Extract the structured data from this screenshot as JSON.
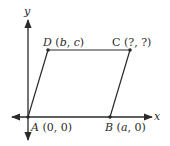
{
  "diagram": {
    "axes": {
      "x_label": "x",
      "y_label": "y"
    },
    "points": [
      {
        "name": "A",
        "coords": "(0, 0)",
        "px": [
          28,
          117
        ]
      },
      {
        "name": "B",
        "coords": "(a, 0)",
        "px": [
          110,
          117
        ]
      },
      {
        "name": "C",
        "coords": "(?, ?)",
        "px": [
          130,
          50
        ]
      },
      {
        "name": "D",
        "coords": "(b, c)",
        "px": [
          48,
          50
        ]
      }
    ],
    "labels": {
      "A": {
        "letter": "A",
        "open": "(",
        "v1": "0",
        "sep": ", ",
        "v2": "0",
        "close": ")"
      },
      "B": {
        "letter": "B",
        "open": "(",
        "v1": "a",
        "sep": ", ",
        "v2": "0",
        "close": ")"
      },
      "C": {
        "letter": "C",
        "open": "(",
        "v1": "?",
        "sep": ", ",
        "v2": "?",
        "close": ")"
      },
      "D": {
        "letter": "D",
        "open": "(",
        "v1": "b",
        "sep": ", ",
        "v2": "c",
        "close": ")"
      }
    },
    "colors": {
      "stroke": "#2a2a2a",
      "background": "#ffffff"
    }
  }
}
